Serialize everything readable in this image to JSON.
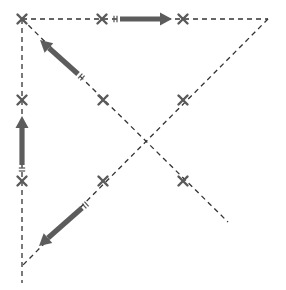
{
  "diagram": {
    "type": "dashed-line path diagram with cross markers and direction arrows",
    "colors": {
      "background": "#ffffff",
      "line": "#333333",
      "marker": "#5a5a5a",
      "arrow": "#5c5c5c"
    },
    "lines": [
      {
        "id": "top-horizontal",
        "x1": 22,
        "y1": 19,
        "x2": 268,
        "y2": 19
      },
      {
        "id": "left-vertical",
        "x1": 22,
        "y1": 19,
        "x2": 22,
        "y2": 283
      },
      {
        "id": "diagonal-down-right",
        "x1": 22,
        "y1": 19,
        "x2": 228,
        "y2": 222
      },
      {
        "id": "diagonal-down-left",
        "x1": 268,
        "y1": 19,
        "x2": 22,
        "y2": 266
      }
    ],
    "markers": [
      {
        "id": "x-top-left",
        "x": 22,
        "y": 19
      },
      {
        "id": "x-top-middle",
        "x": 102,
        "y": 19
      },
      {
        "id": "x-top-right",
        "x": 183,
        "y": 19
      },
      {
        "id": "x-middle-left",
        "x": 22,
        "y": 100
      },
      {
        "id": "x-center-left",
        "x": 103,
        "y": 100
      },
      {
        "id": "x-center-right",
        "x": 183,
        "y": 100
      },
      {
        "id": "x-lower-left",
        "x": 22,
        "y": 181
      },
      {
        "id": "x-lower-center",
        "x": 103,
        "y": 181
      },
      {
        "id": "x-lower-right",
        "x": 183,
        "y": 181
      }
    ],
    "arrows": [
      {
        "id": "arrow-right",
        "direction": "right",
        "x1": 120,
        "y1": 19,
        "x2": 172,
        "y2": 19
      },
      {
        "id": "arrow-up",
        "direction": "up",
        "x1": 22,
        "y1": 165,
        "x2": 22,
        "y2": 116
      },
      {
        "id": "arrow-up-left",
        "direction": "up-left",
        "x1": 78,
        "y1": 74,
        "x2": 40,
        "y2": 40
      },
      {
        "id": "arrow-down-left",
        "direction": "down-left",
        "x1": 82,
        "y1": 208,
        "x2": 39,
        "y2": 246
      }
    ]
  }
}
